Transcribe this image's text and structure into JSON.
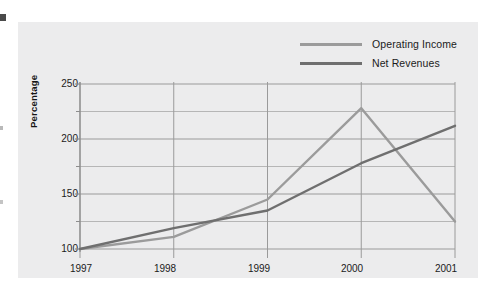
{
  "chart_data": {
    "type": "line",
    "title": "",
    "xlabel": "",
    "ylabel": "Percentage",
    "categories": [
      "1997",
      "1998",
      "1999",
      "2000",
      "2001"
    ],
    "series": [
      {
        "name": "Operating Income",
        "color": "#9b9b9b",
        "values": [
          100,
          111,
          145,
          228,
          125
        ]
      },
      {
        "name": "Net Revenues",
        "color": "#6f6f6f",
        "values": [
          100,
          119,
          135,
          178,
          212
        ]
      }
    ],
    "ylim": [
      90,
      258
    ],
    "yticks": [
      100,
      150,
      200,
      250
    ],
    "yticks_minor": [
      125,
      175,
      225
    ],
    "grid": true,
    "legend_position": "top-right"
  },
  "axis": {
    "y_title": "Percentage",
    "y_labels": [
      "250",
      "200",
      "150",
      "100"
    ],
    "x_labels": [
      "1997",
      "1998",
      "1999",
      "2000",
      "2001"
    ]
  },
  "legend": {
    "items": [
      {
        "label": "Operating Income"
      },
      {
        "label": "Net Revenues"
      }
    ]
  },
  "colors": {
    "panel_background": "#ececed",
    "page_background": "#ffffff",
    "grid": "#9a9a9a",
    "operating_income": "#9b9b9b",
    "net_revenues": "#6f6f6f",
    "text": "#1b1b1b"
  }
}
